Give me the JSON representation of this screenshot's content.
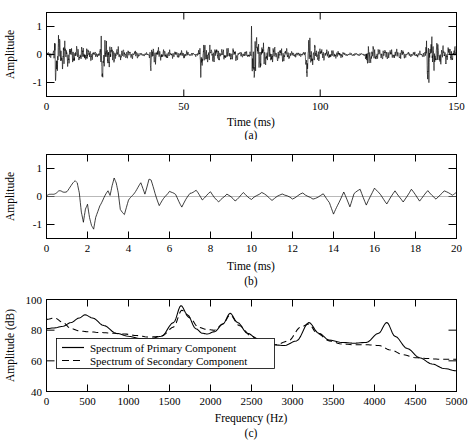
{
  "figure": {
    "panels": [
      {
        "id": "a",
        "caption": "(a)",
        "xlabel": "Time (ms)",
        "ylabel": "Amplitude",
        "xticks": [
          0,
          50,
          100,
          150
        ],
        "xtick_labels": [
          "0",
          "50",
          "100",
          "150"
        ],
        "xminor": [
          10,
          20,
          30,
          40,
          60,
          70,
          80,
          90,
          110,
          120,
          130,
          140
        ],
        "yticks": [
          -1,
          0,
          1
        ],
        "ytick_labels": [
          "-1",
          "0",
          "1"
        ],
        "xlim": [
          0,
          150
        ],
        "ylim": [
          -1.45,
          1.45
        ]
      },
      {
        "id": "b",
        "caption": "(b)",
        "xlabel": "Time (ms)",
        "ylabel": "Amplitude",
        "xticks": [
          0,
          2,
          4,
          6,
          8,
          10,
          12,
          14,
          16,
          18,
          20
        ],
        "xtick_labels": [
          "0",
          "2",
          "4",
          "6",
          "8",
          "10",
          "12",
          "14",
          "16",
          "18",
          "20"
        ],
        "yticks": [
          -1,
          0,
          1
        ],
        "ytick_labels": [
          "-1",
          "0",
          "1"
        ],
        "xlim": [
          0,
          20
        ],
        "ylim": [
          -1.45,
          1.45
        ]
      },
      {
        "id": "c",
        "caption": "(c)",
        "xlabel": "Frequency (Hz)",
        "ylabel": "Amplitude (dB)",
        "xticks": [
          0,
          500,
          1000,
          1500,
          2000,
          2500,
          3000,
          3500,
          4000,
          4500,
          5000
        ],
        "xtick_labels": [
          "0",
          "500",
          "1000",
          "1500",
          "2000",
          "2500",
          "3000",
          "3500",
          "4000",
          "4500",
          "5000"
        ],
        "yticks": [
          40,
          60,
          80,
          100
        ],
        "ytick_labels": [
          "40",
          "60",
          "80",
          "100"
        ],
        "xlim": [
          0,
          5000
        ],
        "ylim": [
          40,
          100
        ],
        "legend": [
          {
            "label": "Spectrum of Primary Component",
            "style": "solid"
          },
          {
            "label": "Spectrum of Secondary Component",
            "style": "dashed"
          }
        ]
      }
    ]
  },
  "chart_data": [
    {
      "type": "line",
      "id": "a",
      "title": "",
      "xlabel": "Time (ms)",
      "ylabel": "Amplitude",
      "xlim": [
        0,
        150
      ],
      "ylim": [
        -1.45,
        1.45
      ],
      "grid": false,
      "description": "Speech waveform over 150 ms showing quasi-periodic glottal bursts approximately every 18-19 ms, peak amplitudes near +1.0 and -1.3",
      "burst_times_ms": [
        3,
        20,
        38,
        56,
        75,
        95,
        117,
        139
      ],
      "series": [
        {
          "name": "Speech waveform",
          "style": "solid",
          "peak_positive": 1.05,
          "peak_negative": -1.35,
          "noise_envelope": 0.25
        }
      ]
    },
    {
      "type": "line",
      "id": "b",
      "title": "",
      "xlabel": "Time (ms)",
      "ylabel": "Amplitude",
      "xlim": [
        0,
        20
      ],
      "ylim": [
        -1.45,
        1.45
      ],
      "grid": false,
      "description": "Expanded 20 ms segment of the waveform; onset transient near 1.5 ms, largest negative excursion -1.15 near 2.3 ms, decaying oscillation with secondary burst near 14 ms",
      "series": [
        {
          "name": "Waveform segment",
          "style": "solid",
          "x": [
            0.0,
            0.2,
            0.4,
            0.6,
            0.8,
            1.0,
            1.2,
            1.4,
            1.5,
            1.6,
            1.7,
            1.8,
            1.9,
            2.0,
            2.1,
            2.2,
            2.3,
            2.4,
            2.6,
            2.8,
            3.0,
            3.1,
            3.2,
            3.3,
            3.4,
            3.5,
            3.6,
            3.8,
            4.0,
            4.2,
            4.4,
            4.6,
            4.8,
            5.0,
            5.1,
            5.3,
            5.5,
            5.7,
            6.0,
            6.3,
            6.6,
            7.0,
            7.3,
            7.6,
            8.0,
            8.4,
            8.8,
            9.2,
            9.6,
            10.0,
            10.5,
            11.0,
            11.5,
            12.0,
            12.5,
            13.0,
            13.5,
            13.8,
            14.0,
            14.2,
            14.5,
            14.8,
            15.0,
            15.3,
            15.6,
            16.0,
            16.3,
            16.6,
            17.0,
            17.4,
            17.8,
            18.2,
            18.6,
            19.0,
            19.4,
            19.8,
            20.0
          ],
          "y": [
            0.02,
            0.05,
            0.12,
            0.18,
            0.14,
            0.2,
            0.35,
            0.55,
            0.5,
            0.15,
            -0.55,
            -0.92,
            -0.45,
            -0.25,
            -0.7,
            -1.0,
            -1.15,
            -0.75,
            -0.3,
            -0.05,
            0.18,
            0.05,
            0.4,
            0.65,
            0.45,
            0.1,
            -0.45,
            -0.6,
            -0.15,
            0.05,
            0.25,
            0.45,
            0.1,
            0.6,
            0.55,
            0.1,
            -0.3,
            -0.1,
            0.2,
            0.05,
            -0.35,
            0.12,
            0.2,
            -0.1,
            0.15,
            -0.2,
            0.1,
            -0.15,
            0.12,
            -0.1,
            0.15,
            -0.12,
            0.1,
            -0.08,
            0.12,
            -0.1,
            0.08,
            -0.2,
            -0.62,
            -0.3,
            0.15,
            -0.35,
            0.1,
            0.25,
            -0.3,
            0.3,
            0.05,
            -0.25,
            0.2,
            -0.2,
            0.25,
            -0.15,
            0.2,
            -0.1,
            0.2,
            0.05,
            0.15
          ]
        }
      ]
    },
    {
      "type": "line",
      "id": "c",
      "title": "",
      "xlabel": "Frequency (Hz)",
      "ylabel": "Amplitude (dB)",
      "xlim": [
        0,
        5000
      ],
      "ylim": [
        40,
        100
      ],
      "grid": false,
      "legend_position": "lower-left",
      "description": "LPC spectral envelopes of two components; primary has formant peaks at 470, 1640, 2240, 3200 and 4150 Hz",
      "series": [
        {
          "name": "Spectrum of Primary Component",
          "style": "solid",
          "formant_peaks_hz": [
            470,
            1640,
            2240,
            3200,
            4150
          ],
          "formant_peak_db": [
            90,
            96,
            91,
            85,
            85
          ],
          "x": [
            0,
            100,
            200,
            300,
            400,
            470,
            560,
            700,
            850,
            1000,
            1150,
            1250,
            1400,
            1550,
            1640,
            1720,
            1820,
            1900,
            1960,
            2050,
            2150,
            2240,
            2330,
            2450,
            2600,
            2750,
            2900,
            3050,
            3200,
            3320,
            3450,
            3600,
            3750,
            3900,
            4050,
            4150,
            4250,
            4400,
            4550,
            4700,
            4850,
            5000
          ],
          "y": [
            81,
            81.5,
            82.5,
            85,
            88,
            90,
            88,
            83,
            78,
            76,
            74.5,
            74,
            76,
            85,
            96,
            90,
            81,
            78,
            77.5,
            79,
            84,
            91,
            85,
            78,
            73,
            70.5,
            70,
            73,
            85,
            78,
            73.5,
            72,
            71.5,
            72,
            78,
            85,
            76,
            68,
            62,
            58,
            55,
            53.5
          ]
        },
        {
          "name": "Spectrum of Secondary Component",
          "style": "dashed",
          "x": [
            0,
            100,
            200,
            300,
            400,
            500,
            650,
            800,
            950,
            1100,
            1250,
            1400,
            1550,
            1650,
            1750,
            1850,
            1950,
            2050,
            2150,
            2240,
            2350,
            2500,
            2650,
            2800,
            2950,
            3100,
            3200,
            3300,
            3450,
            3600,
            3750,
            3900,
            4050,
            4200,
            4350,
            4500,
            4650,
            4800,
            5000
          ],
          "y": [
            87,
            88,
            85,
            81,
            79.5,
            79,
            78.5,
            78,
            77.5,
            76.5,
            75.5,
            76,
            82,
            93,
            88,
            82,
            80.5,
            80,
            84,
            90,
            83,
            76,
            72,
            70.5,
            73,
            82,
            84,
            78,
            73,
            71,
            70.5,
            70.5,
            70,
            67,
            64,
            62,
            61.5,
            61,
            61
          ]
        }
      ]
    }
  ]
}
